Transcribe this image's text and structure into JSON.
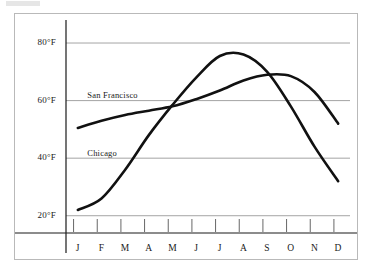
{
  "figure": {
    "name": "average-monthly-temperature-line-chart",
    "background_color": "#ffffff",
    "frame_color": "#b9b9b9",
    "gridline_color": "#999999",
    "axis_color": "#1a1a1a",
    "series_color": "#111111"
  },
  "chart_data": {
    "type": "line",
    "title": "",
    "subtitle": "",
    "xlabel": "",
    "ylabel": "",
    "grid": true,
    "grid_axis": "y",
    "legend": "inline-annotations",
    "legend_position": "inside-plot-left",
    "x": [
      "J",
      "F",
      "M",
      "A",
      "M",
      "J",
      "J",
      "A",
      "S",
      "O",
      "N",
      "D"
    ],
    "x_full": [
      "January",
      "February",
      "March",
      "April",
      "May",
      "June",
      "July",
      "August",
      "September",
      "October",
      "November",
      "December"
    ],
    "categories": [
      "J",
      "F",
      "M",
      "A",
      "M",
      "J",
      "J",
      "A",
      "S",
      "O",
      "N",
      "D"
    ],
    "xlim": [
      0.5,
      12.5
    ],
    "ylim": [
      14,
      88
    ],
    "y_ticks": [
      20,
      40,
      60,
      80
    ],
    "y_tick_labels": [
      "20°F",
      "40°F",
      "60°F",
      "80°F"
    ],
    "unit": "°F",
    "series": [
      {
        "name": "San Francisco",
        "label": "San Francisco",
        "color": "#111111",
        "values": [
          50.5,
          53.0,
          55.0,
          56.5,
          58.0,
          60.5,
          63.5,
          67.0,
          69.0,
          68.5,
          63.0,
          52.0
        ]
      },
      {
        "name": "Chicago",
        "label": "Chicago",
        "color": "#111111",
        "values": [
          22.0,
          26.0,
          36.0,
          48.0,
          58.5,
          68.0,
          75.5,
          76.0,
          70.0,
          58.0,
          44.0,
          32.0
        ]
      }
    ],
    "annotations": [
      {
        "text": "San Francisco",
        "x": 1.4,
        "y": 61.5
      },
      {
        "text": "Chicago",
        "x": 1.4,
        "y": 41.5
      }
    ],
    "crossings": [
      {
        "between": [
          "San Francisco",
          "Chicago"
        ],
        "approx_x": "early May",
        "approx_y": 58
      },
      {
        "between": [
          "San Francisco",
          "Chicago"
        ],
        "approx_x": "early September",
        "approx_y": 69
      }
    ]
  }
}
